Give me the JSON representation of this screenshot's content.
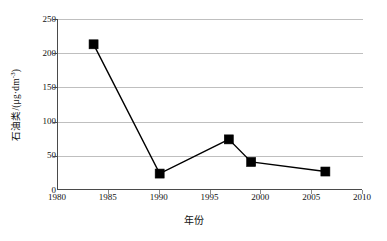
{
  "chart_data": {
    "type": "line",
    "title": "",
    "xlabel": "年份",
    "ylabel": "石油类/(μg·dm⁻³)",
    "ylabel_main": "石油类/(μg·dm",
    "ylabel_exponent": "-3",
    "ylabel_tail": ")",
    "xlim": [
      1980,
      2010
    ],
    "ylim": [
      0,
      250
    ],
    "xticks": [
      1980,
      1985,
      1990,
      1995,
      2000,
      2005,
      2010
    ],
    "yticks": [
      0,
      50,
      100,
      150,
      200,
      250
    ],
    "grid": "horizontal",
    "legend": "none",
    "marker": "filled-square",
    "marker_color": "#000000",
    "line_color": "#000000",
    "grid_color": "#bfbfbf",
    "axis_color": "#4a4a4a",
    "background": "#ffffff",
    "x": [
      1983.5,
      1990.0,
      1996.8,
      1999.0,
      2006.3
    ],
    "values": [
      213,
      24,
      74,
      41,
      27
    ],
    "series": [
      {
        "name": "石油类",
        "points": [
          {
            "x": 1983.5,
            "y": 213
          },
          {
            "x": 1990.0,
            "y": 24
          },
          {
            "x": 1996.8,
            "y": 74
          },
          {
            "x": 1999.0,
            "y": 41
          },
          {
            "x": 2006.3,
            "y": 27
          }
        ]
      }
    ]
  }
}
